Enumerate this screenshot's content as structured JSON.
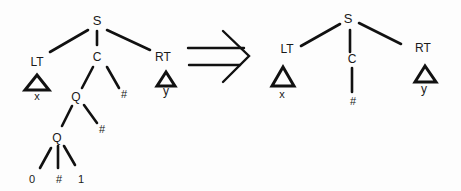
{
  "diagram": {
    "type": "tree-transformation",
    "arrow": "double-arrow-right",
    "before": {
      "root": "S",
      "nodes": {
        "S": "S",
        "LT": "LT",
        "C": "C",
        "RT": "RT",
        "LT_sub": "x",
        "RT_sub": "y",
        "Q1": "Q",
        "C_hash": "#",
        "Q2": "Q",
        "Q1_hash": "#",
        "leaf0": "0",
        "leafHash": "#",
        "leaf1": "1"
      }
    },
    "after": {
      "root": "S",
      "nodes": {
        "S": "S",
        "LT": "LT",
        "C": "C",
        "RT": "RT",
        "LT_sub": "x",
        "RT_sub": "y",
        "C_hash": "#"
      }
    }
  }
}
